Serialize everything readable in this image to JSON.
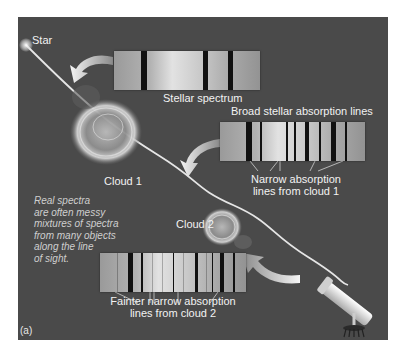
{
  "labels": {
    "star": "Star",
    "stellar_spectrum": "Stellar spectrum",
    "broad_lines": "Broad stellar absorption lines",
    "narrow_lines_cloud1_line1": "Narrow absorption",
    "narrow_lines_cloud1_line2": "lines from cloud 1",
    "cloud1": "Cloud 1",
    "cloud2": "Cloud 2",
    "fainter_lines_line1": "Fainter narrow absorption",
    "fainter_lines_line2": "lines from cloud 2",
    "panel_letter": "(a)"
  },
  "note": {
    "lines": [
      "Real spectra",
      "are often messy",
      "mixtures of spectra",
      "from many objects",
      "along the line",
      "of sight."
    ]
  },
  "spectra": {
    "stellar": {
      "broad_lines_x": [
        27,
        89,
        114
      ]
    },
    "after_cloud1": {
      "broad_lines_x": [
        26,
        72,
        111
      ],
      "narrow_lines_x": [
        40,
        67,
        99,
        125
      ]
    },
    "after_cloud2": {
      "broad_lines_x": [
        27,
        88,
        120
      ],
      "narrow_lines_x": [
        15,
        40,
        62,
        100,
        137
      ]
    }
  },
  "colors": {
    "panel_bg": "#4a4a4a",
    "text": "#f2f2f2",
    "absorption_line": "#111111"
  }
}
